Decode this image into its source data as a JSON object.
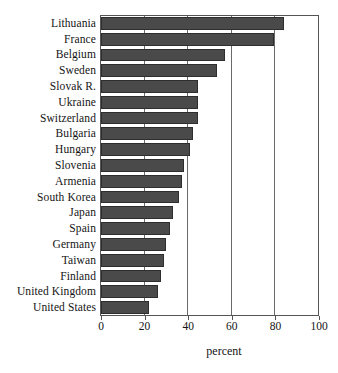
{
  "chart_data": {
    "type": "bar",
    "orientation": "horizontal",
    "title": "",
    "xlabel": "percent",
    "ylabel": "",
    "xlim": [
      0,
      100
    ],
    "xticks": [
      0,
      20,
      40,
      60,
      80,
      100
    ],
    "grid": "vertical gridlines at 20, 40, 60, 80",
    "legend": "none",
    "bar_color": "#4a4a4a",
    "categories": [
      "Lithuania",
      "France",
      "Belgium",
      "Sweden",
      "Slovak R.",
      "Ukraine",
      "Switzerland",
      "Bulgaria",
      "Hungary",
      "Slovenia",
      "Armenia",
      "South Korea",
      "Japan",
      "Spain",
      "Germany",
      "Taiwan",
      "Finland",
      "United Kingdom",
      "United States"
    ],
    "values": [
      84,
      79.5,
      57,
      53,
      44.5,
      44.5,
      44.5,
      42,
      41,
      38,
      37,
      36,
      33,
      31.5,
      30,
      29,
      27.5,
      26,
      22
    ]
  }
}
